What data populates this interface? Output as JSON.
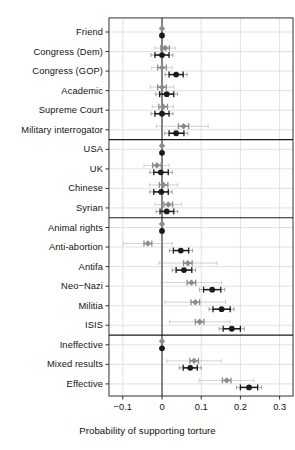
{
  "chart_data": {
    "type": "scatter",
    "title": "",
    "xlabel": "Probability of supporting torture",
    "ylabel": "",
    "xlim": [
      -0.135,
      0.315
    ],
    "xticks": [
      -0.1,
      0,
      0.1,
      0.2,
      0.3
    ],
    "xticklabels": [
      "−0.1",
      "0",
      "0.1",
      "0.2",
      "0.3"
    ],
    "grid": true,
    "legend": "none",
    "orientation": "horizontal-dotplot",
    "reference_line_x": 0,
    "series": [
      {
        "name": "gray-estimate",
        "color": "#8c8c8c",
        "marker": "diamond"
      },
      {
        "name": "black-estimate",
        "color": "#1a1a1a",
        "marker": "circle"
      }
    ],
    "groups": [
      {
        "name": "source",
        "categories": [
          "Friend",
          "Congress (Dem)",
          "Congress (GOP)",
          "Academic",
          "Supreme Court",
          "Military interrogator"
        ]
      },
      {
        "name": "nationality",
        "categories": [
          "USA",
          "UK",
          "Chinese",
          "Syrian"
        ]
      },
      {
        "name": "target",
        "categories": [
          "Animal rights",
          "Anti-abortion",
          "Antifa",
          "Neo−Nazi",
          "Militia",
          "ISIS"
        ]
      },
      {
        "name": "efficacy",
        "categories": [
          "Ineffective",
          "Mixed results",
          "Effective"
        ]
      }
    ],
    "categories": [
      "Friend",
      "Congress (Dem)",
      "Congress (GOP)",
      "Academic",
      "Supreme Court",
      "Military interrogator",
      "USA",
      "UK",
      "Chinese",
      "Syrian",
      "Animal rights",
      "Anti-abortion",
      "Antifa",
      "Neo−Nazi",
      "Militia",
      "ISIS",
      "Ineffective",
      "Mixed results",
      "Effective"
    ],
    "points": [
      {
        "category": "Friend",
        "gray": {
          "x": 0.0,
          "lo": 0.0,
          "hi": 0.0,
          "lo_outer": 0.0,
          "hi_outer": 0.0,
          "reference": true
        },
        "black": {
          "x": 0.0,
          "lo": 0.0,
          "hi": 0.0,
          "lo_outer": 0.0,
          "hi_outer": 0.0,
          "reference": true
        }
      },
      {
        "category": "Congress (Dem)",
        "gray": {
          "x": 0.008,
          "lo": -0.003,
          "hi": 0.019,
          "lo_outer": -0.018,
          "hi_outer": 0.034
        },
        "black": {
          "x": 0.0,
          "lo": -0.018,
          "hi": 0.018,
          "lo_outer": -0.028,
          "hi_outer": 0.028
        }
      },
      {
        "category": "Congress (GOP)",
        "gray": {
          "x": 0.0,
          "lo": -0.011,
          "hi": 0.011,
          "lo_outer": -0.026,
          "hi_outer": 0.026
        },
        "black": {
          "x": 0.036,
          "lo": 0.018,
          "hi": 0.054,
          "lo_outer": 0.008,
          "hi_outer": 0.064
        }
      },
      {
        "category": "Academic",
        "gray": {
          "x": 0.0,
          "lo": -0.011,
          "hi": 0.011,
          "lo_outer": -0.03,
          "hi_outer": 0.03
        },
        "black": {
          "x": 0.012,
          "lo": -0.006,
          "hi": 0.03,
          "lo_outer": -0.016,
          "hi_outer": 0.04
        }
      },
      {
        "category": "Supreme Court",
        "gray": {
          "x": 0.003,
          "lo": -0.008,
          "hi": 0.014,
          "lo_outer": -0.025,
          "hi_outer": 0.029
        },
        "black": {
          "x": 0.0,
          "lo": -0.018,
          "hi": 0.018,
          "lo_outer": -0.028,
          "hi_outer": 0.028
        }
      },
      {
        "category": "Military interrogator",
        "gray": {
          "x": 0.055,
          "lo": 0.042,
          "hi": 0.068,
          "lo_outer": -0.014,
          "hi_outer": 0.118
        },
        "black": {
          "x": 0.036,
          "lo": 0.018,
          "hi": 0.056,
          "lo_outer": 0.006,
          "hi_outer": 0.066
        }
      },
      {
        "category": "USA",
        "gray": {
          "x": 0.0,
          "lo": 0.0,
          "hi": 0.0,
          "lo_outer": 0.0,
          "hi_outer": 0.0,
          "reference": true
        },
        "black": {
          "x": 0.0,
          "lo": 0.0,
          "hi": 0.0,
          "lo_outer": 0.0,
          "hi_outer": 0.0,
          "reference": true
        }
      },
      {
        "category": "UK",
        "gray": {
          "x": -0.013,
          "lo": -0.024,
          "hi": -0.002,
          "lo_outer": -0.046,
          "hi_outer": 0.018
        },
        "black": {
          "x": -0.003,
          "lo": -0.021,
          "hi": 0.016,
          "lo_outer": -0.031,
          "hi_outer": 0.026
        }
      },
      {
        "category": "Chinese",
        "gray": {
          "x": 0.004,
          "lo": -0.007,
          "hi": 0.015,
          "lo_outer": -0.032,
          "hi_outer": 0.04
        },
        "black": {
          "x": -0.002,
          "lo": -0.021,
          "hi": 0.016,
          "lo_outer": -0.031,
          "hi_outer": 0.026
        }
      },
      {
        "category": "Syrian",
        "gray": {
          "x": 0.016,
          "lo": 0.005,
          "hi": 0.027,
          "lo_outer": -0.018,
          "hi_outer": 0.05
        },
        "black": {
          "x": 0.012,
          "lo": -0.005,
          "hi": 0.03,
          "lo_outer": -0.015,
          "hi_outer": 0.04
        }
      },
      {
        "category": "Animal rights",
        "gray": {
          "x": 0.0,
          "lo": 0.0,
          "hi": 0.0,
          "lo_outer": 0.0,
          "hi_outer": 0.0,
          "reference": true
        },
        "black": {
          "x": 0.0,
          "lo": 0.0,
          "hi": 0.0,
          "lo_outer": 0.0,
          "hi_outer": 0.0,
          "reference": true
        }
      },
      {
        "category": "Anti-abortion",
        "gray": {
          "x": -0.036,
          "lo": -0.046,
          "hi": -0.026,
          "lo_outer": -0.098,
          "hi_outer": 0.026
        },
        "black": {
          "x": 0.048,
          "lo": 0.029,
          "hi": 0.068,
          "lo_outer": 0.019,
          "hi_outer": 0.078
        }
      },
      {
        "category": "Antifa",
        "gray": {
          "x": 0.066,
          "lo": 0.055,
          "hi": 0.077,
          "lo_outer": -0.008,
          "hi_outer": 0.14
        },
        "black": {
          "x": 0.056,
          "lo": 0.036,
          "hi": 0.076,
          "lo_outer": 0.026,
          "hi_outer": 0.086
        }
      },
      {
        "category": "Neo−Nazi",
        "gray": {
          "x": 0.075,
          "lo": 0.064,
          "hi": 0.086,
          "lo_outer": -0.002,
          "hi_outer": 0.152
        },
        "black": {
          "x": 0.128,
          "lo": 0.106,
          "hi": 0.15,
          "lo_outer": 0.096,
          "hi_outer": 0.16
        }
      },
      {
        "category": "Militia",
        "gray": {
          "x": 0.085,
          "lo": 0.074,
          "hi": 0.096,
          "lo_outer": 0.008,
          "hi_outer": 0.162
        },
        "black": {
          "x": 0.152,
          "lo": 0.13,
          "hi": 0.174,
          "lo_outer": 0.12,
          "hi_outer": 0.184
        }
      },
      {
        "category": "ISIS",
        "gray": {
          "x": 0.096,
          "lo": 0.085,
          "hi": 0.107,
          "lo_outer": 0.019,
          "hi_outer": 0.173
        },
        "black": {
          "x": 0.178,
          "lo": 0.156,
          "hi": 0.2,
          "lo_outer": 0.146,
          "hi_outer": 0.21
        }
      },
      {
        "category": "Ineffective",
        "gray": {
          "x": 0.0,
          "lo": 0.0,
          "hi": 0.0,
          "lo_outer": 0.0,
          "hi_outer": 0.0,
          "reference": true
        },
        "black": {
          "x": 0.0,
          "lo": 0.0,
          "hi": 0.0,
          "lo_outer": 0.0,
          "hi_outer": 0.0,
          "reference": true
        }
      },
      {
        "category": "Mixed results",
        "gray": {
          "x": 0.082,
          "lo": 0.071,
          "hi": 0.093,
          "lo_outer": 0.012,
          "hi_outer": 0.152
        },
        "black": {
          "x": 0.072,
          "lo": 0.054,
          "hi": 0.09,
          "lo_outer": 0.044,
          "hi_outer": 0.1
        }
      },
      {
        "category": "Effective",
        "gray": {
          "x": 0.165,
          "lo": 0.154,
          "hi": 0.176,
          "lo_outer": 0.095,
          "hi_outer": 0.235
        },
        "black": {
          "x": 0.222,
          "lo": 0.2,
          "hi": 0.244,
          "lo_outer": 0.19,
          "hi_outer": 0.254
        }
      }
    ],
    "group_dividers_after": [
      "Military interrogator",
      "Syrian",
      "ISIS"
    ]
  },
  "colors": {
    "gray_marker": "#8c8c8c",
    "black_marker": "#1a1a1a",
    "grid": "#d9d9d9",
    "axis": "#333333",
    "background": "#ffffff"
  }
}
